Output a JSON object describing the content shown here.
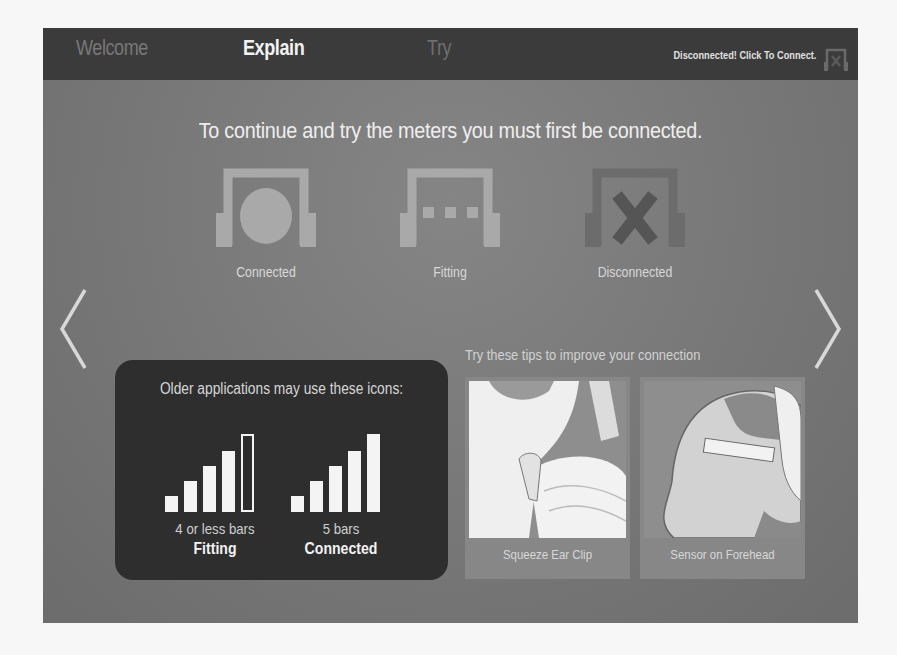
{
  "nav": {
    "tabs": [
      {
        "label": "Welcome",
        "state": "inactive"
      },
      {
        "label": "Explain",
        "state": "active"
      },
      {
        "label": "Try",
        "state": "disabled"
      }
    ],
    "connection_status": "Disconnected! Click To Connect.",
    "connection_icon": "headset-disconnected-icon"
  },
  "main": {
    "headline": "To continue and try the meters you must first be connected.",
    "status_icons": [
      {
        "label": "Connected",
        "icon": "headset-connected-icon"
      },
      {
        "label": "Fitting",
        "icon": "headset-fitting-icon"
      },
      {
        "label": "Disconnected",
        "icon": "headset-disconnected-icon"
      }
    ],
    "prev_arrow": "chevron-left-icon",
    "next_arrow": "chevron-right-icon"
  },
  "older_apps": {
    "title": "Older applications may use these icons:",
    "groups": [
      {
        "caption": "4 or less bars",
        "state": "Fitting",
        "filled_bars": 4,
        "total_bars": 5
      },
      {
        "caption": "5 bars",
        "state": "Connected",
        "filled_bars": 5,
        "total_bars": 5
      }
    ]
  },
  "tips": {
    "title": "Try these tips to improve your connection",
    "items": [
      {
        "label": "Squeeze Ear Clip"
      },
      {
        "label": "Sensor on Forehead"
      }
    ]
  },
  "colors": {
    "navbar": "#3b3b3b",
    "background": "#7a7a7a",
    "panel": "#2e2e2e",
    "active_text": "#f2f2f2"
  }
}
